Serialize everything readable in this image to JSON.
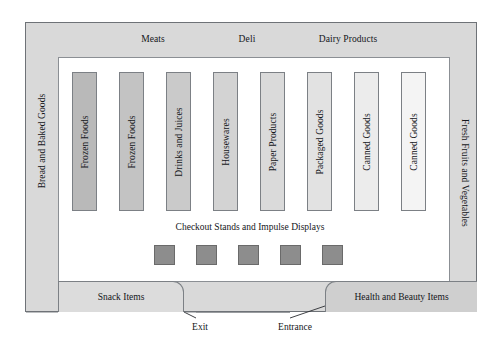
{
  "diagram": {
    "perimeter_departments": {
      "top": [
        {
          "name": "meats",
          "label": "Meats"
        },
        {
          "name": "deli",
          "label": "Deli"
        },
        {
          "name": "dairy",
          "label": "Dairy Products"
        }
      ],
      "left": {
        "name": "bread-baked-goods",
        "label": "Bread and Baked Goods"
      },
      "right": {
        "name": "fresh-produce",
        "label": "Fresh Fruits and Vegetables"
      }
    },
    "aisles": [
      {
        "label": "Frozen Foods",
        "fill": "#b9b9b9",
        "x": 72
      },
      {
        "label": "Frozen Foods",
        "fill": "#c3c3c3",
        "x": 119
      },
      {
        "label": "Drinks and Juices",
        "fill": "#cacaca",
        "x": 166
      },
      {
        "label": "Housewares",
        "fill": "#d3d3d3",
        "x": 213
      },
      {
        "label": "Paper Products",
        "fill": "#dadada",
        "x": 260
      },
      {
        "label": "Packaged Goods",
        "fill": "#e2e2e2",
        "x": 307
      },
      {
        "label": "Canned Goods",
        "fill": "#ececec",
        "x": 354
      },
      {
        "label": "Canned Goods",
        "fill": "#f4f4f4",
        "x": 401
      }
    ],
    "checkout": {
      "caption": "Checkout Stands and Impulse Displays",
      "stand_color": "#8d8d8d",
      "stands": [
        {
          "label": "Checkout Stand 1",
          "x": 154
        },
        {
          "label": "Checkout Stand 2",
          "x": 196
        },
        {
          "label": "Checkout Stand 3",
          "x": 238
        },
        {
          "label": "Checkout Stand 4",
          "x": 280
        },
        {
          "label": "Checkout Stand 5",
          "x": 322
        }
      ]
    },
    "front_blocks": [
      {
        "name": "snack-items",
        "label": "Snack Items"
      },
      {
        "name": "health-beauty-items",
        "label": "Health and Beauty Items"
      }
    ],
    "doors": [
      {
        "name": "exit",
        "label": "Exit"
      },
      {
        "name": "entrance",
        "label": "Entrance"
      }
    ],
    "colors": {
      "perimeter_band": "#d9d9d9",
      "sales_floor": "#ffffff",
      "outline": "#6e7277",
      "text": "#14161a"
    }
  }
}
